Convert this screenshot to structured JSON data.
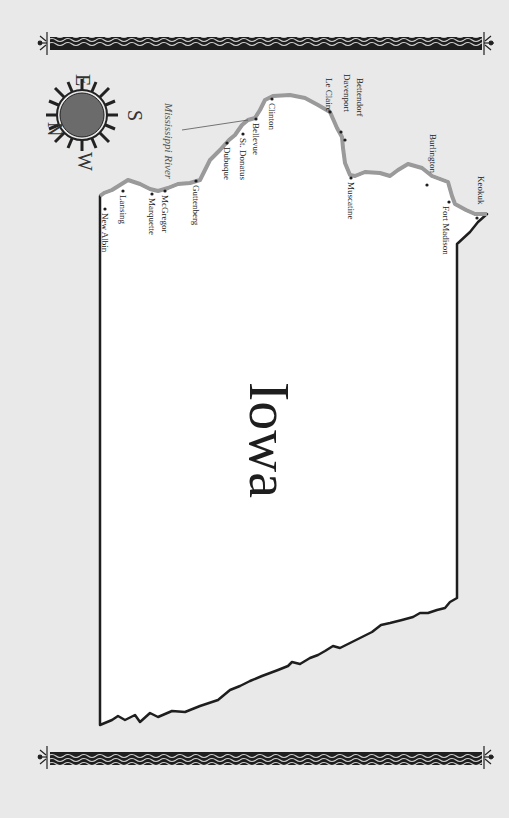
{
  "map": {
    "state_label": "Iowa",
    "river_label": "Mississippi River",
    "colors": {
      "background": "#e9e9e9",
      "land": "#ffffff",
      "border": "#1e1e1e",
      "river": "#9a9a9a",
      "compass_fill": "#6b6b6b"
    },
    "compass": {
      "north": "N",
      "east": "E",
      "south": "S",
      "west": "W"
    },
    "cities": [
      {
        "name": "New Albin"
      },
      {
        "name": "Lansing"
      },
      {
        "name": "Marquette"
      },
      {
        "name": "McGregor"
      },
      {
        "name": "Guttenberg"
      },
      {
        "name": "Dubuque"
      },
      {
        "name": "St. Donatus"
      },
      {
        "name": "Bellevue"
      },
      {
        "name": "Clinton"
      },
      {
        "name": "Le Claire"
      },
      {
        "name": "Davenport"
      },
      {
        "name": "Bettendorf"
      },
      {
        "name": "Muscatine"
      },
      {
        "name": "Burlington"
      },
      {
        "name": "Fort Madison"
      },
      {
        "name": "Keokuk"
      }
    ]
  }
}
